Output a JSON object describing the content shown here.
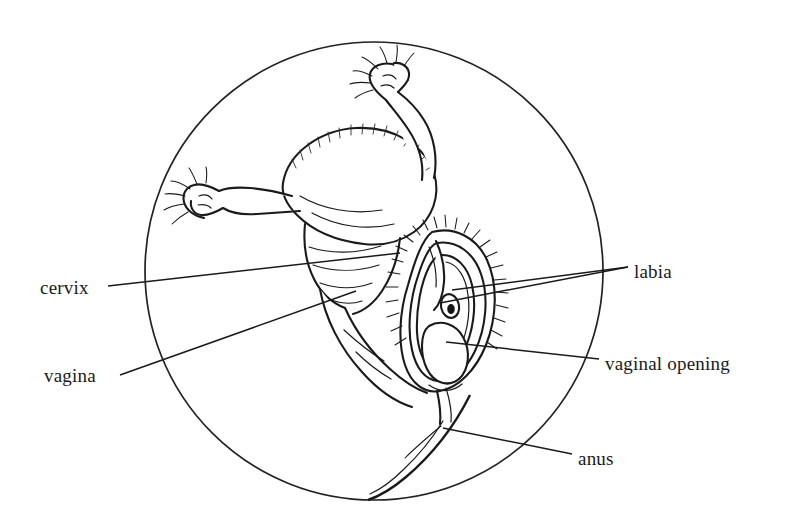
{
  "figure": {
    "type": "anatomical-line-drawing",
    "background_color": "#ffffff",
    "ink_color": "#1a1a1a",
    "frame": {
      "shape": "circle",
      "center_x": 374,
      "center_y": 271,
      "radius": 229
    },
    "labels": [
      {
        "id": "cervix",
        "text": "cervix",
        "side": "left",
        "x": 40,
        "y": 278,
        "leader": {
          "x1": 108,
          "y1": 286,
          "x2": 400,
          "y2": 253
        }
      },
      {
        "id": "vagina",
        "text": "vagina",
        "side": "left",
        "x": 44,
        "y": 366,
        "leader": {
          "x1": 120,
          "y1": 375,
          "x2": 356,
          "y2": 291
        }
      },
      {
        "id": "labia",
        "text": "labia",
        "side": "right",
        "x": 634,
        "y": 262,
        "leader_a": {
          "x1": 628,
          "y1": 267,
          "x2": 452,
          "y2": 290
        },
        "leader_b": {
          "x1": 628,
          "y1": 267,
          "x2": 440,
          "y2": 303
        }
      },
      {
        "id": "vaginal-opening",
        "text": "vaginal opening",
        "side": "right",
        "x": 605,
        "y": 354,
        "leader": {
          "x1": 599,
          "y1": 359,
          "x2": 446,
          "y2": 342
        }
      },
      {
        "id": "anus",
        "text": "anus",
        "side": "right",
        "x": 578,
        "y": 449,
        "leader": {
          "x1": 572,
          "y1": 454,
          "x2": 443,
          "y2": 428
        }
      }
    ],
    "structures": [
      "uterus",
      "left-fallopian-tube",
      "right-fallopian-tube",
      "left-ovary",
      "right-ovary",
      "cervix",
      "vaginal-canal",
      "vulva",
      "labia-majora",
      "labia-minora",
      "vaginal-opening",
      "pubic-hair",
      "perineum",
      "anus"
    ]
  }
}
